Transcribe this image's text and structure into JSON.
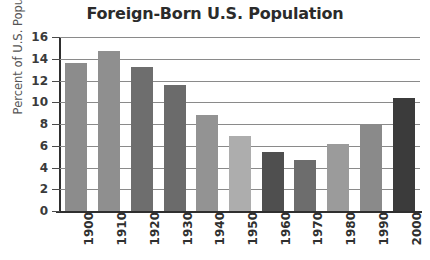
{
  "chart_data": {
    "type": "bar",
    "title": "Foreign-Born U.S. Population",
    "xlabel": "",
    "ylabel": "Percent of U.S. Population",
    "categories": [
      "1900",
      "1910",
      "1920",
      "1930",
      "1940",
      "1950",
      "1960",
      "1970",
      "1980",
      "1990",
      "2000"
    ],
    "values": [
      13.6,
      14.7,
      13.2,
      11.6,
      8.8,
      6.9,
      5.4,
      4.7,
      6.2,
      7.9,
      10.4
    ],
    "ylim": [
      0,
      16
    ],
    "yticks": [
      0,
      2,
      4,
      6,
      8,
      10,
      12,
      14,
      16
    ],
    "ytick_labels": [
      "0",
      "2",
      "4",
      "6",
      "8",
      "10",
      "12",
      "14",
      "16"
    ],
    "grid": true,
    "grid_axis": "y",
    "legend": null,
    "bar_colors": [
      "#8c8c8c",
      "#8f8f8f",
      "#6e6e6e",
      "#6b6b6b",
      "#939393",
      "#adadad",
      "#4f4f4f",
      "#6d6d6d",
      "#9b9b9b",
      "#8a8a8a",
      "#3b3b3b"
    ]
  },
  "style": {
    "background": "#ffffff",
    "axis_color": "#2f2f2f",
    "grid_color": "#8a8a8a",
    "title_color": "#2b2b2b",
    "label_color": "#555555"
  }
}
